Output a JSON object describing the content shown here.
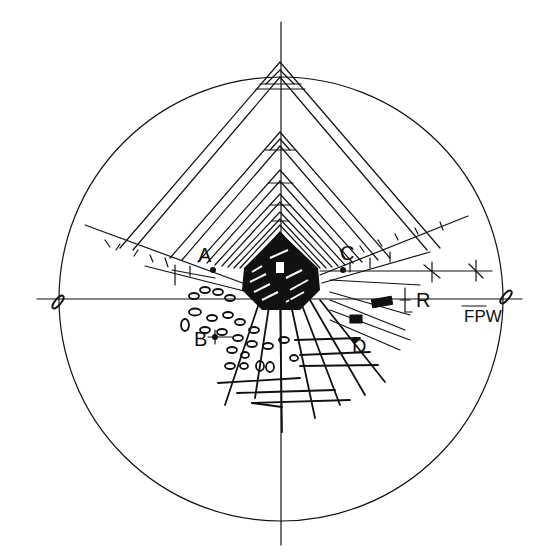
{
  "drawing": {
    "title": "Perspective sketch of a vaulted corridor within a circular frame",
    "labels": {
      "a": "A",
      "b": "B",
      "c": "C",
      "d": "D",
      "r": "R"
    },
    "signature": "FPW",
    "ink_color": "#111111",
    "background_color": "#ffffff"
  }
}
